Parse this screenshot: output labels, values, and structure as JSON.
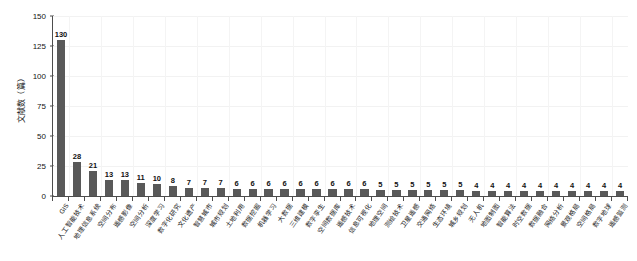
{
  "chart_data": {
    "type": "bar",
    "title": "",
    "subtitle": "",
    "xlabel": "",
    "ylabel": "文献数（篇）",
    "ylim": [
      0,
      150
    ],
    "yticks": [
      0,
      25,
      50,
      75,
      100,
      125,
      150
    ],
    "grid": true,
    "legend": "none",
    "orientation": "vertical",
    "value_labels": true,
    "bar_color": "#595959",
    "axis_color": "#4d4d4d",
    "grid_color": "#f2f2f2",
    "background_color": "#ffffff",
    "label_rotation_deg": -55,
    "categories": [
      "GIS",
      "人工智能技术",
      "地理信息系统",
      "空间分布",
      "遥感影像",
      "空间分析",
      "深度学习",
      "数字化研究",
      "文化遗产",
      "智慧城市",
      "城市规划",
      "土地利用",
      "数据挖掘",
      "机器学习",
      "大数据",
      "三维建模",
      "数字孪生",
      "空间数据库",
      "遥感技术",
      "信息可视化",
      "地理空间",
      "测绘技术",
      "卫星遥感",
      "交通网络",
      "生态环境",
      "城乡规划",
      "无人机",
      "地图制图",
      "智能算法",
      "时空数据",
      "数据融合",
      "网络分析",
      "景观格局",
      "空间格局",
      "数字地球",
      "遥感监测"
    ],
    "values": [
      130,
      28,
      21,
      13,
      13,
      11,
      10,
      8,
      7,
      7,
      7,
      6,
      6,
      6,
      6,
      6,
      6,
      6,
      6,
      6,
      5,
      5,
      5,
      5,
      5,
      5,
      4,
      4,
      4,
      4,
      4,
      4,
      4,
      4,
      4,
      4
    ]
  }
}
